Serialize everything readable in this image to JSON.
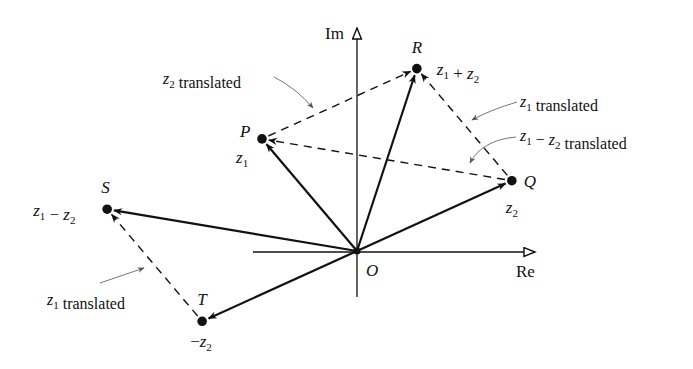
{
  "axes": {
    "real_label": "Re",
    "imag_label": "Im",
    "origin_label": "O"
  },
  "points": [
    {
      "id": "O",
      "label": "O",
      "value": [
        0,
        0
      ]
    },
    {
      "id": "P",
      "label": "P",
      "expr": [
        {
          "t": "z"
        },
        {
          "s": "1"
        }
      ],
      "value": [
        -1.0,
        1.18
      ]
    },
    {
      "id": "Q",
      "label": "Q",
      "expr": [
        {
          "t": "z"
        },
        {
          "s": "2"
        }
      ],
      "value": [
        1.63,
        0.74
      ]
    },
    {
      "id": "R",
      "label": "R",
      "expr": [
        {
          "t": "z"
        },
        {
          "s": "1"
        },
        {
          "o": " + "
        },
        {
          "t": "z"
        },
        {
          "s": "2"
        }
      ],
      "value": [
        0.63,
        1.92
      ]
    },
    {
      "id": "S",
      "label": "S",
      "expr": [
        {
          "t": "z"
        },
        {
          "s": "1"
        },
        {
          "o": " − "
        },
        {
          "t": "z"
        },
        {
          "s": "2"
        }
      ],
      "value": [
        -2.63,
        0.44
      ]
    },
    {
      "id": "T",
      "label": "T",
      "expr": [
        {
          "o": "−"
        },
        {
          "t": "z"
        },
        {
          "s": "2"
        }
      ],
      "value": [
        -1.63,
        -0.74
      ]
    }
  ],
  "vectors": [
    {
      "name": "vector-z1",
      "from": "O",
      "to": "P",
      "style": "solid"
    },
    {
      "name": "vector-z2",
      "from": "O",
      "to": "Q",
      "style": "solid"
    },
    {
      "name": "vector-z1-plus-z2",
      "from": "O",
      "to": "R",
      "style": "solid"
    },
    {
      "name": "vector-z1-minus-z2",
      "from": "O",
      "to": "S",
      "style": "solid"
    },
    {
      "name": "vector-minus-z2",
      "from": "O",
      "to": "T",
      "style": "solid"
    },
    {
      "name": "vector-z2-translated",
      "from": "P",
      "to": "R",
      "style": "dashed"
    },
    {
      "name": "vector-z1-translated-upper",
      "from": "Q",
      "to": "R",
      "style": "dashed"
    },
    {
      "name": "vector-z1-minus-z2-translated",
      "from": "Q",
      "to": "P",
      "style": "dashed"
    },
    {
      "name": "vector-z1-translated-lower",
      "from": "T",
      "to": "S",
      "style": "dashed"
    }
  ],
  "annotations": [
    {
      "name": "annotation-z2-translated",
      "parts": [
        {
          "t": "z"
        },
        {
          "s": "2"
        },
        {
          "o": " translated"
        }
      ]
    },
    {
      "name": "annotation-z1-translated-upper",
      "parts": [
        {
          "t": "z"
        },
        {
          "s": "1"
        },
        {
          "o": " translated"
        }
      ]
    },
    {
      "name": "annotation-z1-minus-z2-translated",
      "parts": [
        {
          "t": "z"
        },
        {
          "s": "1"
        },
        {
          "o": " − "
        },
        {
          "t": "z"
        },
        {
          "s": "2"
        },
        {
          "o": " translated"
        }
      ]
    },
    {
      "name": "annotation-z1-translated-lower",
      "parts": [
        {
          "t": "z"
        },
        {
          "s": "1"
        },
        {
          "o": " translated"
        }
      ]
    }
  ],
  "colors": {
    "ink": "#111111",
    "pointer": "#666666"
  }
}
